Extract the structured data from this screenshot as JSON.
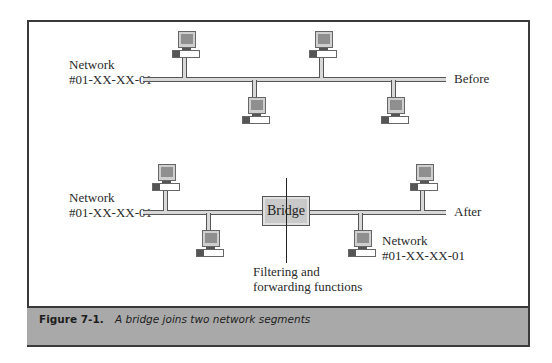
{
  "diagram": {
    "before": {
      "network_label_line1": "Network",
      "network_label_line2": "#01-XX-XX-01",
      "state_label": "Before",
      "computers": 4
    },
    "after": {
      "left_network_label_line1": "Network",
      "left_network_label_line2": "#01-XX-XX-01",
      "right_network_label_line1": "Network",
      "right_network_label_line2": "#01-XX-XX-01",
      "state_label": "After",
      "bridge_label": "Bridge",
      "function_label_line1": "Filtering and",
      "function_label_line2": "forwarding functions",
      "computers": 4
    }
  },
  "caption": {
    "label": "Figure 7-1.",
    "text": "A bridge joins two network segments"
  }
}
